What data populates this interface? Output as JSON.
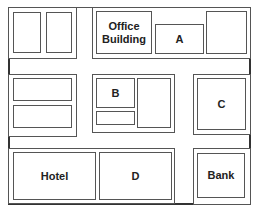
{
  "map": {
    "labels": {
      "office_building": "Office Building",
      "a": "A",
      "b": "B",
      "c": "C",
      "d": "D",
      "hotel": "Hotel",
      "bank": "Bank"
    },
    "colors": {
      "line": "#555555",
      "background": "#ffffff",
      "text": "#222222"
    }
  }
}
